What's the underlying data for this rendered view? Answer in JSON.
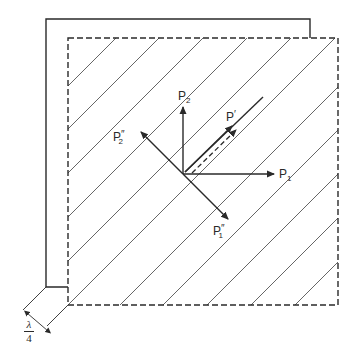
{
  "diagram": {
    "colors": {
      "line": "#2a2a2a",
      "hatch": "#555555",
      "background": "#ffffff"
    },
    "labels": {
      "p2": {
        "base": "P",
        "sub": "2",
        "prime": ""
      },
      "p1": {
        "base": "P",
        "sub": "1",
        "prime": ""
      },
      "p_prime": {
        "base": "P",
        "sub": "",
        "prime": "′"
      },
      "p2_double": {
        "base": "P",
        "sub": "2",
        "prime": "″"
      },
      "p1_double": {
        "base": "P",
        "sub": "1",
        "prime": "″"
      }
    },
    "dimension": {
      "numerator": "λ",
      "denominator": "4"
    },
    "vectors": [
      {
        "name": "P2",
        "direction": "up"
      },
      {
        "name": "P1",
        "direction": "right"
      },
      {
        "name": "P'",
        "direction": "up-right (45°)",
        "style": "solid"
      },
      {
        "name": "P' component",
        "direction": "up-right (45°)",
        "style": "dashed"
      },
      {
        "name": "P2''",
        "direction": "up-left"
      },
      {
        "name": "P1''",
        "direction": "down-right"
      }
    ],
    "elements": {
      "outer_frame": "solid L-shaped offset plate edge",
      "inner_plate": "dashed square with diagonal hatching",
      "hatch_count": 10
    }
  }
}
